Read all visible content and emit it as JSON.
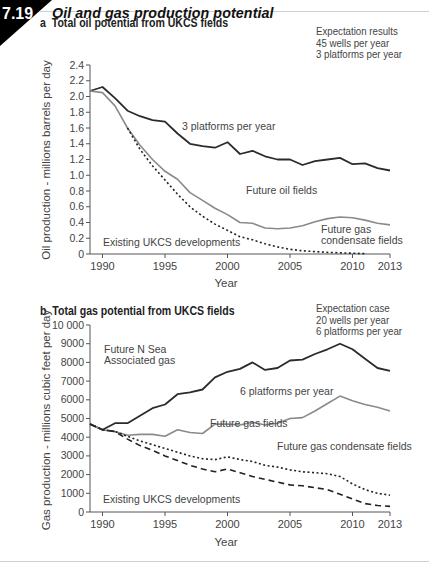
{
  "figure": {
    "number": "7.19",
    "title": "Oil and gas production potential"
  },
  "chart_data": [
    {
      "type": "line",
      "panel": "a",
      "title": "Total oil potential from UKCS fields",
      "xlabel": "Year",
      "ylabel": "Oil production - millions barrels per day",
      "xlim": [
        1989,
        2013
      ],
      "ylim": [
        0,
        2.4
      ],
      "xticks": [
        "1990",
        "1995",
        "2000",
        "2005",
        "2010",
        "2013"
      ],
      "yticks": [
        "0",
        "0.2",
        "0.4",
        "0.6",
        "0.8",
        "1.0",
        "1.2",
        "1.4",
        "1.6",
        "1.8",
        "2.0",
        "2.2",
        "2.4"
      ],
      "note": [
        "Expectation results",
        "45 wells per year",
        "3 platforms per year"
      ],
      "x": [
        1989,
        1990,
        1991,
        1992,
        1993,
        1994,
        1995,
        1996,
        1997,
        1998,
        1999,
        2000,
        2001,
        2002,
        2003,
        2004,
        2005,
        2006,
        2007,
        2008,
        2009,
        2010,
        2011,
        2012,
        2013
      ],
      "series": [
        {
          "name": "3 platforms per year",
          "style": "solid-dark",
          "values": [
            2.07,
            2.12,
            1.98,
            1.82,
            1.75,
            1.7,
            1.68,
            1.53,
            1.4,
            1.37,
            1.35,
            1.42,
            1.27,
            1.31,
            1.24,
            1.2,
            1.2,
            1.13,
            1.18,
            1.2,
            1.22,
            1.14,
            1.15,
            1.09,
            1.06
          ]
        },
        {
          "name": "Future gas condensate fields",
          "style": "solid-grey",
          "values": [
            2.07,
            2.05,
            1.88,
            1.6,
            1.38,
            1.2,
            1.05,
            0.95,
            0.78,
            0.68,
            0.58,
            0.5,
            0.4,
            0.39,
            0.33,
            0.32,
            0.33,
            0.36,
            0.41,
            0.45,
            0.47,
            0.46,
            0.43,
            0.39,
            0.37
          ]
        },
        {
          "name": "Existing UKCS developments",
          "style": "dotted",
          "values": [
            null,
            null,
            null,
            1.6,
            1.33,
            1.12,
            0.94,
            0.76,
            0.6,
            0.48,
            0.38,
            0.3,
            0.22,
            0.18,
            0.13,
            0.09,
            0.06,
            0.04,
            0.03,
            0.02,
            0.015,
            0.01,
            0.005,
            null,
            null
          ]
        }
      ],
      "annotations": [
        {
          "text": "3 platforms per year"
        },
        {
          "text": "Future oil fields"
        },
        {
          "text": "Future gas"
        },
        {
          "text": "condensate fields"
        },
        {
          "text": "Existing UKCS developments"
        }
      ]
    },
    {
      "type": "line",
      "panel": "b",
      "title": "Total gas potential from UKCS fields",
      "xlabel": "Year",
      "ylabel": "Gas production - millions cubic feet per day",
      "xlim": [
        1989,
        2013
      ],
      "ylim": [
        0,
        10000
      ],
      "xticks": [
        "1990",
        "1995",
        "2000",
        "2005",
        "2010",
        "2013"
      ],
      "yticks": [
        "0",
        "1000",
        "2000",
        "3000",
        "4000",
        "5000",
        "6000",
        "7000",
        "8000",
        "9000",
        "10 000"
      ],
      "note": [
        "Expectation case",
        "20 wells per year",
        "6 platforms per year"
      ],
      "x": [
        1989,
        1990,
        1991,
        1992,
        1993,
        1994,
        1995,
        1996,
        1997,
        1998,
        1999,
        2000,
        2001,
        2002,
        2003,
        2004,
        2005,
        2006,
        2007,
        2008,
        2009,
        2010,
        2011,
        2012,
        2013
      ],
      "series": [
        {
          "name": "6 platforms per year",
          "style": "solid-dark",
          "values": [
            4700,
            4400,
            4750,
            4750,
            5150,
            5550,
            5750,
            6300,
            6400,
            6550,
            7200,
            7500,
            7650,
            8000,
            7600,
            7700,
            8100,
            8150,
            8450,
            8700,
            9000,
            8700,
            8200,
            7700,
            7550
          ]
        },
        {
          "name": "Future gas fields",
          "style": "solid-grey",
          "values": [
            4700,
            4400,
            4300,
            4100,
            4150,
            4150,
            4050,
            4400,
            4250,
            4200,
            4700,
            4700,
            4650,
            4800,
            4650,
            4750,
            5000,
            5050,
            5400,
            5800,
            6200,
            5950,
            5750,
            5600,
            5400
          ]
        },
        {
          "name": "Future gas condensate fields",
          "style": "dotted",
          "values": [
            4700,
            4400,
            4300,
            4050,
            3800,
            3600,
            3400,
            3200,
            3000,
            2850,
            2800,
            2950,
            2800,
            2700,
            2500,
            2400,
            2250,
            2150,
            2100,
            2050,
            1900,
            1500,
            1200,
            1000,
            900
          ]
        },
        {
          "name": "Existing UKCS developments",
          "style": "dashed",
          "values": [
            4700,
            4400,
            4300,
            3900,
            3550,
            3300,
            3000,
            2750,
            2500,
            2300,
            2150,
            2300,
            2100,
            1900,
            1750,
            1600,
            1450,
            1400,
            1300,
            1200,
            950,
            700,
            450,
            350,
            300
          ]
        }
      ],
      "annotations": [
        {
          "text": "Future N Sea"
        },
        {
          "text": "Associated gas"
        },
        {
          "text": "6 platforms per year"
        },
        {
          "text": "Future gas fields"
        },
        {
          "text": "Future gas condensate fields"
        },
        {
          "text": "Existing UKCS developments"
        }
      ]
    }
  ],
  "colors": {
    "dark_line": "#2b2b2b",
    "grey_line": "#8a8a8a",
    "axis": "#555555",
    "badge": "#000000"
  }
}
